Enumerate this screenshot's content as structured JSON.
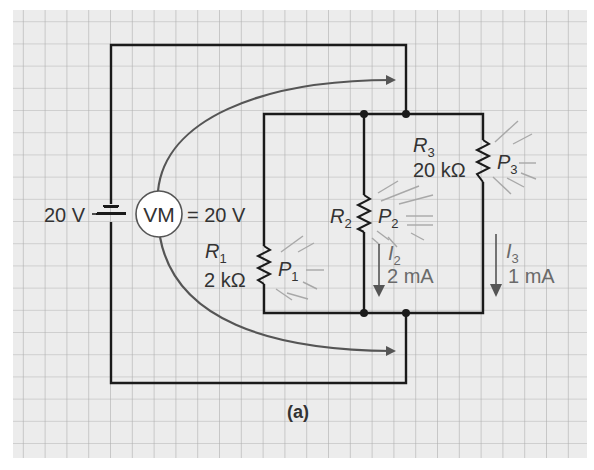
{
  "figure": {
    "caption": "(a)",
    "colors": {
      "background": "#ececec",
      "grid": "#b0b0b0",
      "wire": "#1a1a1a",
      "arrow": "#555555",
      "text": "#333333",
      "current_text": "#6a6a6a",
      "glow": "#999999"
    }
  },
  "source": {
    "voltage_label": "20 V"
  },
  "voltmeter": {
    "label": "VM",
    "reading": "= 20 V"
  },
  "resistors": [
    {
      "name": "R",
      "sub": "1",
      "value": "2 kΩ",
      "power_name": "P",
      "power_sub": "1"
    },
    {
      "name": "R",
      "sub": "2",
      "value": "",
      "power_name": "P",
      "power_sub": "2"
    },
    {
      "name": "R",
      "sub": "3",
      "value": "20 kΩ",
      "power_name": "P",
      "power_sub": "3"
    }
  ],
  "currents": [
    {
      "name": "I",
      "sub": "2",
      "value": "2 mA"
    },
    {
      "name": "I",
      "sub": "3",
      "value": "1 mA"
    }
  ]
}
